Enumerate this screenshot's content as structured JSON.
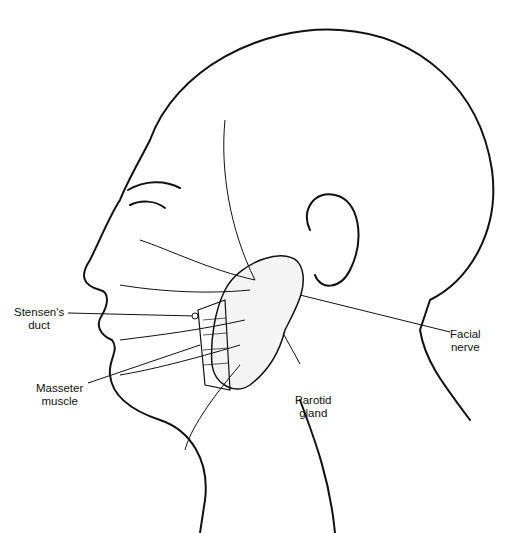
{
  "figure": {
    "labels": [
      {
        "id": "stensens_duct",
        "line1": "Stensen's",
        "line2": "duct"
      },
      {
        "id": "masseter_muscle",
        "line1": "Masseter",
        "line2": "muscle"
      },
      {
        "id": "parotid_gland",
        "line1": "Parotid",
        "line2": "gland"
      },
      {
        "id": "facial_nerve",
        "line1": "Facial",
        "line2": "nerve"
      }
    ]
  }
}
